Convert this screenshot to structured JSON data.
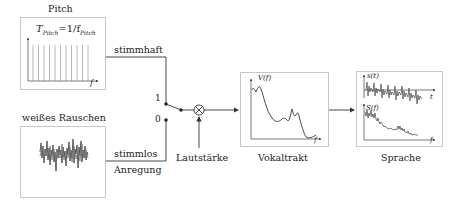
{
  "diagram": {
    "blocks": {
      "pitch": {
        "title": "Pitch",
        "formula": "T_Pitch = 1/f_Pitch",
        "formula_main": "T",
        "formula_sub1": "Pitch",
        "formula_eq": "=1/f",
        "formula_sub2": "Pitch",
        "axis_x": "f",
        "impulse_count": 11
      },
      "noise": {
        "title": "weißes Rauschen"
      },
      "vocal_tract": {
        "title": "Vokaltrakt",
        "axis_y": "V(f)",
        "axis_x": "f"
      },
      "speech": {
        "title": "Sprache",
        "axis_y_top": "s(t)",
        "axis_x_top": "t",
        "axis_y_bottom": "S(f)",
        "axis_x_bottom": "f"
      }
    },
    "edges": {
      "voiced": "stimmhaft",
      "unvoiced": "stimmlos",
      "excitation": "Anregung",
      "gain": "Lautstärke"
    },
    "switch": {
      "pos_1": "1",
      "pos_0": "0"
    },
    "multiplier_symbol": "⊗",
    "colors": {
      "line": "#333333",
      "box_border": "#c8c8c8",
      "signal": "#444444"
    }
  }
}
